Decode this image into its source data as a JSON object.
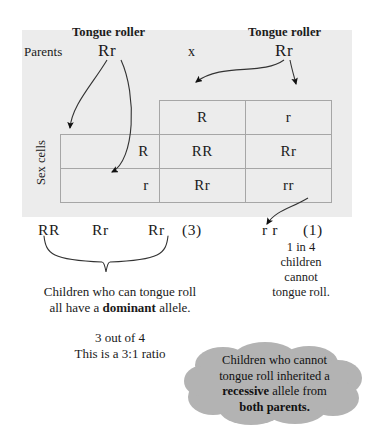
{
  "diagram": {
    "parents_label": "Parents",
    "cross_symbol": "x",
    "parent_left": {
      "phenotype": "Tongue roller",
      "genotype": "Rr"
    },
    "parent_right": {
      "phenotype": "Tongue roller",
      "genotype": "Rr"
    },
    "sex_cells_label": "Sex cells",
    "punnett": {
      "column_gametes": [
        "R",
        "r"
      ],
      "row_gametes": [
        "R",
        "r"
      ],
      "cells": [
        [
          "RR",
          "Rr"
        ],
        [
          "Rr",
          "rr"
        ]
      ]
    },
    "offspring": {
      "dominant_genotypes": [
        "RR",
        "Rr",
        "Rr"
      ],
      "dominant_count": "(3)",
      "recessive_genotype": "r r",
      "recessive_count": "(1)"
    },
    "captions": {
      "left_line1": "Children who can tongue roll",
      "left_line2_pre": "all have a ",
      "left_line2_bold": "dominant",
      "left_line2_post": " allele.",
      "ratio_line1": "3 out of 4",
      "ratio_line2": "This is a 3:1 ratio",
      "right_line1": "1 in 4",
      "right_line2": "children",
      "right_line3": "cannot",
      "right_line4": "tongue roll."
    },
    "cloud": {
      "line1": "Children who cannot",
      "line2": "tongue roll inherited a",
      "line3_bold": "recessive",
      "line3_post": " allele from",
      "line4_bold": "both parents."
    },
    "colors": {
      "panel": "#ececec",
      "grid_line": "#a6a6a6",
      "cloud": "#b3b3b3",
      "text": "#1a1a1a"
    }
  }
}
